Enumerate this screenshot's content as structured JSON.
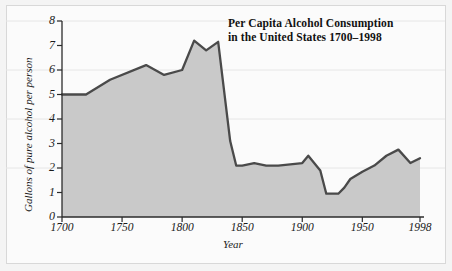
{
  "chart_data": {
    "type": "area",
    "title": "Per Capita Alcohol Consumption in the United States 1700–1998",
    "title_line1": "Per Capita Alcohol Consumption",
    "title_line2": "in the United States 1700–1998",
    "xlabel": "Year",
    "ylabel": "Gallons of pure alcohol per person",
    "xlim": [
      1700,
      1998
    ],
    "ylim": [
      0,
      8
    ],
    "xticks": [
      1700,
      1750,
      1800,
      1850,
      1900,
      1950,
      1998
    ],
    "xtick_labels": [
      "1700",
      "1750",
      "1800",
      "1850",
      "1900",
      "1950",
      "1998"
    ],
    "yticks": [
      0,
      1,
      2,
      3,
      4,
      5,
      6,
      7,
      8
    ],
    "ytick_labels": [
      "0",
      "1",
      "2",
      "3",
      "4",
      "5",
      "6",
      "7",
      "8"
    ],
    "grid": false,
    "legend": "none",
    "line_color": "#4a4a4a",
    "fill_color": "#c9c9c9",
    "x": [
      1700,
      1720,
      1740,
      1770,
      1785,
      1800,
      1810,
      1820,
      1830,
      1840,
      1845,
      1850,
      1860,
      1870,
      1880,
      1890,
      1900,
      1905,
      1915,
      1920,
      1930,
      1935,
      1940,
      1950,
      1960,
      1970,
      1980,
      1990,
      1998
    ],
    "values": [
      5.0,
      5.0,
      5.6,
      6.2,
      5.8,
      6.0,
      7.2,
      6.8,
      7.15,
      3.1,
      2.1,
      2.1,
      2.2,
      2.1,
      2.1,
      2.15,
      2.2,
      2.5,
      1.9,
      0.95,
      0.95,
      1.2,
      1.55,
      1.85,
      2.1,
      2.5,
      2.75,
      2.2,
      2.4
    ]
  }
}
